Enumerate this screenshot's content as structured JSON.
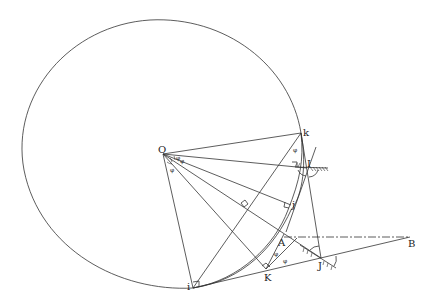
{
  "diagram": {
    "type": "geometric-construction",
    "points": {
      "O": {
        "label": "O",
        "x": 163,
        "y": 154
      },
      "k": {
        "label": "k",
        "x": 301,
        "y": 133
      },
      "I": {
        "label": "I",
        "x": 307,
        "y": 166
      },
      "j": {
        "label": "j",
        "x": 291,
        "y": 204
      },
      "A": {
        "label": "A",
        "x": 281,
        "y": 237
      },
      "B": {
        "label": "B",
        "x": 410,
        "y": 237
      },
      "K": {
        "label": "K",
        "x": 267,
        "y": 271
      },
      "J": {
        "label": "J",
        "x": 321,
        "y": 257
      },
      "i": {
        "label": "i",
        "x": 193,
        "y": 288
      }
    },
    "angle_symbol": "φ",
    "right_angle_markers": [
      "i",
      "K",
      "j",
      "I",
      "midline"
    ],
    "lines": [
      "O-k",
      "O-I",
      "O-j",
      "O-J",
      "O-K",
      "O-i",
      "k-i",
      "k-J",
      "i-B",
      "K-A",
      "A-B (dash-dot)",
      "k-I-j arc",
      "J-mirror",
      "I-mirror"
    ]
  }
}
